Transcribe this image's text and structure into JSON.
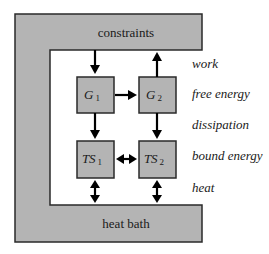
{
  "diagram": {
    "frame": {
      "top_label": "constraints",
      "bottom_label": "heat bath",
      "fill_color": "#b4b4b4",
      "stroke_color": "#2a2a2a"
    },
    "boxes": [
      {
        "id": "G1",
        "main": "G",
        "sub": "1"
      },
      {
        "id": "G2",
        "main": "G",
        "sub": "2"
      },
      {
        "id": "TS1",
        "main": "TS",
        "sub": "1"
      },
      {
        "id": "TS2",
        "main": "TS",
        "sub": "2"
      }
    ],
    "side_labels": [
      "work",
      "free energy",
      "dissipation",
      "bound energy",
      "heat"
    ],
    "arrows": [
      {
        "from": "constraints",
        "to": "G1",
        "type": "single"
      },
      {
        "from": "G2",
        "to": "constraints",
        "type": "single"
      },
      {
        "from": "G1",
        "to": "G2",
        "type": "single"
      },
      {
        "from": "G1",
        "to": "TS1",
        "type": "single"
      },
      {
        "from": "G2",
        "to": "TS2",
        "type": "single"
      },
      {
        "from": "TS1",
        "to": "TS2",
        "type": "double"
      },
      {
        "from": "TS1",
        "to": "heat bath",
        "type": "double"
      },
      {
        "from": "TS2",
        "to": "heat bath",
        "type": "double"
      }
    ]
  }
}
